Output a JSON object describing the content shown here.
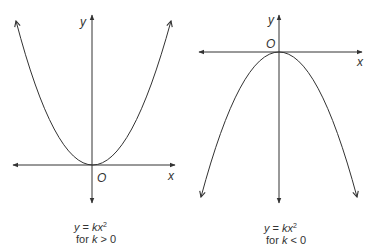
{
  "graphs": [
    {
      "id": "k-positive",
      "axis_labels": {
        "y": "y",
        "x": "x",
        "origin": "O"
      },
      "caption": {
        "equation_lhs": "y",
        "equation_eq": " = ",
        "equation_k": "k",
        "equation_x": "x",
        "equation_exp": "2",
        "condition_prefix": "for ",
        "condition_var": "k",
        "condition_rel": " > 0"
      },
      "shape": "upward parabola"
    },
    {
      "id": "k-negative",
      "axis_labels": {
        "y": "y",
        "x": "x",
        "origin": "O"
      },
      "caption": {
        "equation_lhs": "y",
        "equation_eq": " = ",
        "equation_k": "k",
        "equation_x": "x",
        "equation_exp": "2",
        "condition_prefix": "for ",
        "condition_var": "k",
        "condition_rel": " < 0"
      },
      "shape": "downward parabola"
    }
  ],
  "colors": {
    "line": "#333333",
    "background": "#ffffff"
  }
}
